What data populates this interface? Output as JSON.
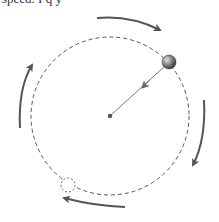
{
  "caption_fragment": "speed. I q y",
  "diagram": {
    "orbit": {
      "cx": 110,
      "cy": 116,
      "r": 79,
      "style": "dashed"
    },
    "center_point": {
      "x": 110,
      "y": 116
    },
    "ball": {
      "x": 169,
      "y": 62,
      "r": 7
    },
    "ghost_ball": {
      "x": 68,
      "y": 185,
      "r": 7,
      "style": "dashed"
    },
    "radius_vector": {
      "from": "ball",
      "to": "center",
      "label": "force toward center"
    },
    "rotation_direction": "clockwise",
    "colors": {
      "arrow": "#555555",
      "orbit": "#555555",
      "ball": "#666666"
    }
  }
}
